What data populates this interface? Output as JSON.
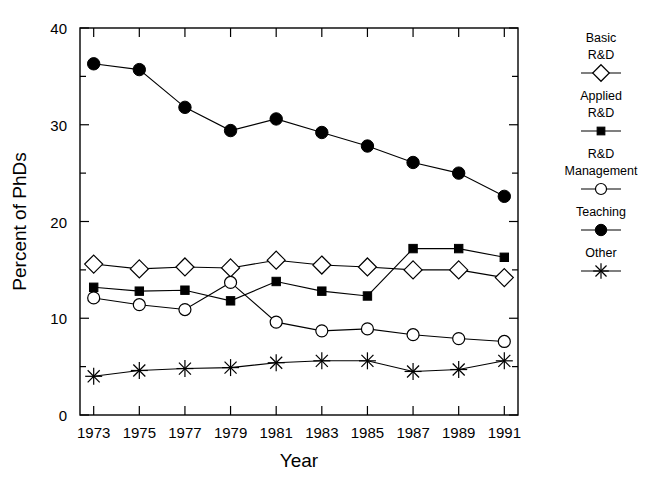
{
  "chart_data": {
    "type": "line",
    "title": "",
    "xlabel": "Year",
    "ylabel": "Percent of PhDs",
    "x": [
      1973,
      1975,
      1977,
      1979,
      1981,
      1983,
      1985,
      1987,
      1989,
      1991
    ],
    "xtick_labels": [
      "1973",
      "1975",
      "1977",
      "1979",
      "1981",
      "1983",
      "1985",
      "1987",
      "1989",
      "1991"
    ],
    "ytick_labels": [
      "0",
      "10",
      "20",
      "30",
      "40"
    ],
    "yticks": [
      0,
      10,
      20,
      30,
      40
    ],
    "yminor_ticks": [
      5,
      15,
      25,
      35
    ],
    "ylim": [
      0,
      40
    ],
    "xlim": [
      1972.4,
      1991.6
    ],
    "grid": false,
    "legend_position": "right",
    "series": [
      {
        "name": "Basic R&D",
        "marker": "open-diamond",
        "values": [
          15.6,
          15.1,
          15.3,
          15.2,
          16.0,
          15.5,
          15.3,
          15.0,
          15.0,
          14.2
        ]
      },
      {
        "name": "Applied R&D",
        "marker": "filled-square",
        "values": [
          13.2,
          12.8,
          12.9,
          11.8,
          13.8,
          12.8,
          12.3,
          17.2,
          17.2,
          16.3
        ]
      },
      {
        "name": "R&D Management",
        "marker": "open-circle",
        "values": [
          12.1,
          11.4,
          10.9,
          13.7,
          9.6,
          8.7,
          8.9,
          8.3,
          7.9,
          7.6
        ]
      },
      {
        "name": "Teaching",
        "marker": "filled-circle",
        "values": [
          36.3,
          35.7,
          31.8,
          29.4,
          30.6,
          29.2,
          27.8,
          26.1,
          25.0,
          22.6
        ]
      },
      {
        "name": "Other",
        "marker": "asterisk",
        "values": [
          4.0,
          4.6,
          4.8,
          4.9,
          5.4,
          5.6,
          5.6,
          4.5,
          4.7,
          5.6
        ]
      }
    ]
  },
  "legend": {
    "entries": [
      {
        "label_line1": "Basic",
        "label_line2": "R&D",
        "marker": "open-diamond"
      },
      {
        "label_line1": "Applied",
        "label_line2": "R&D",
        "marker": "filled-square"
      },
      {
        "label_line1": "R&D",
        "label_line2": "Management",
        "marker": "open-circle"
      },
      {
        "label_line1": "Teaching",
        "label_line2": "",
        "marker": "filled-circle"
      },
      {
        "label_line1": "Other",
        "label_line2": "",
        "marker": "asterisk"
      }
    ]
  },
  "colors": {
    "foreground": "#000000",
    "background": "#ffffff"
  }
}
